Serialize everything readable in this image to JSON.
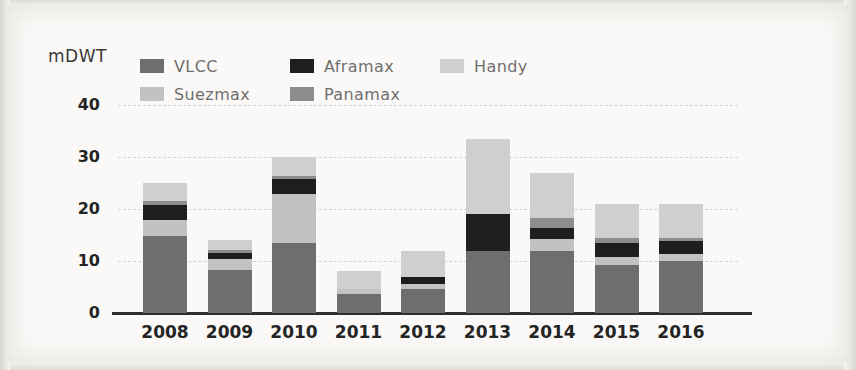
{
  "axis": {
    "y_title": "mDWT",
    "y_ticks": [
      "40",
      "30",
      "20",
      "10",
      "0"
    ],
    "x_ticks": [
      "2008",
      "2009",
      "2010",
      "2011",
      "2012",
      "2013",
      "2014",
      "2015",
      "2016"
    ]
  },
  "legend": {
    "items": [
      {
        "label": "VLCC",
        "color": "#6e6e6e"
      },
      {
        "label": "Aframax",
        "color": "#1e1e1e"
      },
      {
        "label": "Handy",
        "color": "#cfcfcf"
      },
      {
        "label": "Suezmax",
        "color": "#c2c2c2"
      },
      {
        "label": "Panamax",
        "color": "#8d8d8d"
      }
    ]
  },
  "chart_data": {
    "type": "bar",
    "title": "",
    "subtype": "stacked",
    "xlabel": "",
    "ylabel": "mDWT",
    "ylim": [
      0,
      40
    ],
    "yticks": [
      0,
      10,
      20,
      30,
      40
    ],
    "grid": true,
    "legend_position": "top",
    "categories": [
      "2008",
      "2009",
      "2010",
      "2011",
      "2012",
      "2013",
      "2014",
      "2015",
      "2016"
    ],
    "series": [
      {
        "name": "VLCC",
        "color": "#6e6e6e",
        "values": [
          14.8,
          8.3,
          13.4,
          3.6,
          4.6,
          12.0,
          12.0,
          9.3,
          10.0
        ]
      },
      {
        "name": "Suezmax",
        "color": "#c2c2c2",
        "values": [
          3.0,
          2.1,
          9.4,
          1.0,
          1.0,
          0.0,
          2.2,
          1.4,
          1.3
        ]
      },
      {
        "name": "Aframax",
        "color": "#1e1e1e",
        "values": [
          3.0,
          1.2,
          3.0,
          0.0,
          1.4,
          7.0,
          2.2,
          2.7,
          2.6
        ]
      },
      {
        "name": "Panamax",
        "color": "#8d8d8d",
        "values": [
          0.7,
          0.6,
          0.5,
          0.0,
          0.0,
          0.0,
          1.9,
          1.1,
          0.6
        ]
      },
      {
        "name": "Handy",
        "color": "#cfcfcf",
        "values": [
          3.5,
          1.8,
          3.7,
          3.4,
          5.0,
          14.5,
          8.7,
          6.5,
          6.5
        ]
      }
    ],
    "totals": [
      25.0,
      14.0,
      30.0,
      8.0,
      12.0,
      33.5,
      27.0,
      21.0,
      21.0
    ]
  }
}
